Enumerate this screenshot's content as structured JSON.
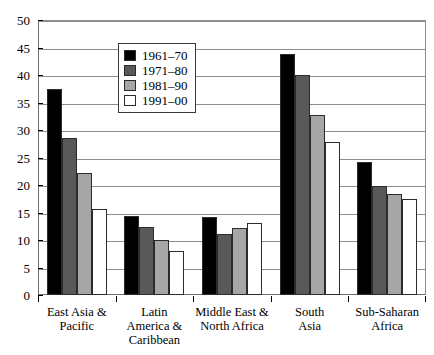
{
  "chart_data": {
    "type": "bar",
    "title": "",
    "xlabel": "",
    "ylabel": "",
    "ylim": [
      0,
      50
    ],
    "ytick_step": 5,
    "yticks": [
      "50",
      "45",
      "40",
      "35",
      "30",
      "25",
      "20",
      "15",
      "10",
      "5",
      "0"
    ],
    "grid": true,
    "legend_position": "upper-left-inside",
    "categories": [
      "East Asia &\nPacific",
      "Latin\nAmerica &\nCaribbean",
      "Middle East &\nNorth Africa",
      "South\nAsia",
      "Sub-Saharan\nAfrica"
    ],
    "category_lines": [
      [
        "East Asia &",
        "Pacific"
      ],
      [
        "Latin",
        "America &",
        "Caribbean"
      ],
      [
        "Middle East &",
        "North Africa"
      ],
      [
        "South",
        "Asia"
      ],
      [
        "Sub-Saharan",
        "Africa"
      ]
    ],
    "series": [
      {
        "name": "1961–70",
        "color": "#000000",
        "values": [
          37.4,
          14.3,
          14.2,
          43.8,
          24.2
        ]
      },
      {
        "name": "1971–80",
        "color": "#595959",
        "values": [
          28.5,
          12.3,
          11.1,
          40.0,
          19.9
        ]
      },
      {
        "name": "1981–90",
        "color": "#a6a6a6",
        "values": [
          22.2,
          10.0,
          12.2,
          32.8,
          18.3
        ]
      },
      {
        "name": "1991–00",
        "color": "#ffffff",
        "values": [
          15.6,
          8.0,
          13.1,
          27.9,
          17.4
        ]
      }
    ]
  },
  "legend": {
    "items": [
      {
        "label": "1961–70",
        "color": "#000000"
      },
      {
        "label": "1971–80",
        "color": "#595959"
      },
      {
        "label": "1981–90",
        "color": "#a6a6a6"
      },
      {
        "label": "1991–00",
        "color": "#ffffff"
      }
    ]
  },
  "style": {
    "grid_color": "#8d8d8d",
    "frame_color": "#6f6f6f",
    "bar_outline": "#2b2b2b",
    "background": "#ffffff"
  }
}
